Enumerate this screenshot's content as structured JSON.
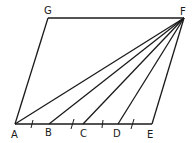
{
  "diagram": {
    "type": "geometry",
    "stroke_color": "#1a1a1a",
    "points": {
      "A": {
        "label": "A",
        "x": 15,
        "y": 124
      },
      "B": {
        "label": "B",
        "x": 49,
        "y": 124
      },
      "C": {
        "label": "C",
        "x": 83,
        "y": 124
      },
      "D": {
        "label": "D",
        "x": 118,
        "y": 124
      },
      "E": {
        "label": "E",
        "x": 152,
        "y": 124
      },
      "F": {
        "label": "F",
        "x": 184,
        "y": 18
      },
      "G": {
        "label": "G",
        "x": 48,
        "y": 18
      }
    },
    "segments": [
      [
        "A",
        "E"
      ],
      [
        "E",
        "F"
      ],
      [
        "F",
        "G"
      ],
      [
        "G",
        "A"
      ],
      [
        "A",
        "F"
      ],
      [
        "B",
        "F"
      ],
      [
        "C",
        "F"
      ],
      [
        "D",
        "F"
      ]
    ],
    "tick_marks": [
      {
        "between": [
          "A",
          "B"
        ]
      },
      {
        "between": [
          "B",
          "C"
        ]
      },
      {
        "between": [
          "C",
          "D"
        ]
      },
      {
        "between": [
          "D",
          "E"
        ]
      }
    ]
  }
}
